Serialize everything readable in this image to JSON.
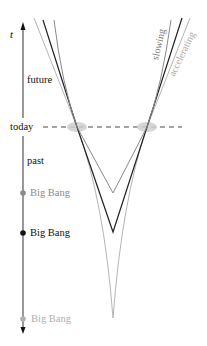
{
  "diagram": {
    "axis_label": "t",
    "labels": {
      "future": "future",
      "today": "today",
      "past": "past"
    },
    "big_bangs": [
      {
        "label": "Big Bang",
        "model": "slowing",
        "color": "#8a8a8a",
        "y": 193
      },
      {
        "label": "Big Bang",
        "model": "constant",
        "color": "#111111",
        "y": 232
      },
      {
        "label": "Big Bang",
        "model": "accelerating",
        "color": "#b0b0b0",
        "y": 319
      }
    ],
    "curve_labels": {
      "slowing": "slowing",
      "accelerating": "accelerating"
    },
    "colors": {
      "slowing": "#8a8a8a",
      "constant": "#222222",
      "accelerating": "#b5b5b5",
      "today_marker": "#cfcfcf",
      "axis": "#333333"
    }
  }
}
